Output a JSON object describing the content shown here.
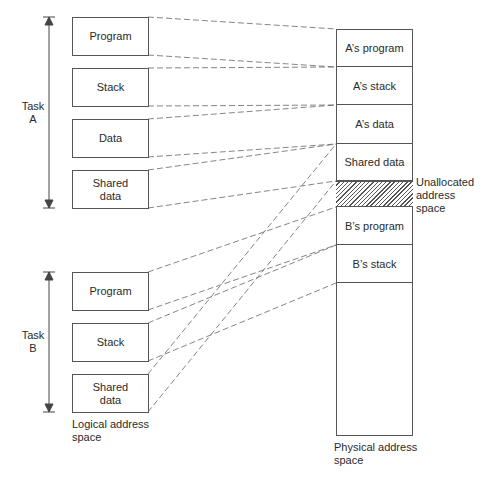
{
  "logical": {
    "task_a": {
      "label": "Task\nA",
      "segments": [
        {
          "label": "Program"
        },
        {
          "label": "Stack"
        },
        {
          "label": "Data"
        },
        {
          "label": "Shared\ndata"
        }
      ]
    },
    "task_b": {
      "label": "Task\nB",
      "segments": [
        {
          "label": "Program"
        },
        {
          "label": "Stack"
        },
        {
          "label": "Shared\ndata"
        }
      ]
    },
    "caption": "Logical address\nspace"
  },
  "physical": {
    "segments": [
      {
        "label": "A’s program"
      },
      {
        "label": "A’s stack"
      },
      {
        "label": "A’s data"
      },
      {
        "label": "Shared data"
      },
      {
        "label": ""
      },
      {
        "label": "B’s program"
      },
      {
        "label": "B’s stack"
      }
    ],
    "unallocated_label": "Unallocated\naddress\nspace",
    "caption": "Physical address\nspace"
  },
  "mappings": [
    {
      "from": "Task A Program",
      "to": "A’s program"
    },
    {
      "from": "Task A Stack",
      "to": "A’s stack"
    },
    {
      "from": "Task A Data",
      "to": "A’s data"
    },
    {
      "from": "Task A Shared data",
      "to": "Shared data"
    },
    {
      "from": "Task B Program",
      "to": "B’s program"
    },
    {
      "from": "Task B Stack",
      "to": "B’s stack"
    },
    {
      "from": "Task B Shared data",
      "to": "Shared data"
    }
  ]
}
